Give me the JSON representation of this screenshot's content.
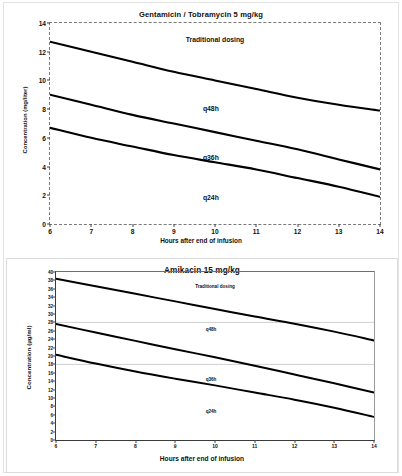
{
  "document": {
    "kind": "two-panel pharmacokinetic figure"
  },
  "charts": [
    {
      "id": "gentamicin-tobramycin",
      "title": "Gentamicin / Tobramycin   5 mg/kg",
      "xlabel": "Hours after end of infusion",
      "ylabel": "Concentration (mg/liter)",
      "xticks": [
        "6",
        "7",
        "8",
        "9",
        "10",
        "11",
        "12",
        "13",
        "14"
      ],
      "yticks": [
        "0",
        "2",
        "4",
        "6",
        "8",
        "10",
        "12",
        "14"
      ],
      "annotations": [
        {
          "text": "Traditional dosing",
          "x": 10.0,
          "y": 12.9
        },
        {
          "text": "q48h",
          "x": 9.9,
          "y": 8.1
        },
        {
          "text": "q36h",
          "x": 9.9,
          "y": 4.7
        },
        {
          "text": "q24h",
          "x": 9.9,
          "y": 1.9
        }
      ]
    },
    {
      "id": "amikacin",
      "title": "Amikacin  15 mg/kg",
      "xlabel": "Hours after end of infusion",
      "ylabel": "Concentration (µg/ml)",
      "xticks": [
        "6",
        "7",
        "8",
        "9",
        "10",
        "11",
        "12",
        "13",
        "14"
      ],
      "yticks": [
        "0",
        "2",
        "4",
        "6",
        "8",
        "10",
        "12",
        "14",
        "16",
        "18",
        "20",
        "22",
        "24",
        "26",
        "28",
        "30",
        "32",
        "34",
        "36",
        "38",
        "40"
      ],
      "annotations": [
        {
          "text": "Traditional dosing",
          "x": 10.0,
          "y": 36.6
        },
        {
          "text": "q48h",
          "x": 9.9,
          "y": 26.4
        },
        {
          "text": "q36h",
          "x": 9.9,
          "y": 14.6
        },
        {
          "text": "q24h",
          "x": 9.9,
          "y": 6.9
        }
      ]
    }
  ],
  "chart_data": [
    {
      "type": "line",
      "id": "gentamicin-tobramycin",
      "title": "Gentamicin / Tobramycin   5 mg/kg",
      "xlabel": "Hours after end of infusion",
      "ylabel": "Concentration (mg/liter)",
      "xlim": [
        6,
        14
      ],
      "ylim": [
        0,
        14
      ],
      "xticks": [
        6,
        7,
        8,
        9,
        10,
        11,
        12,
        13,
        14
      ],
      "yticks": [
        0,
        2,
        4,
        6,
        8,
        10,
        12,
        14
      ],
      "grid": false,
      "border_style": "dashed",
      "legend": "inline-labels",
      "x": [
        6,
        7,
        8,
        9,
        10,
        11,
        12,
        13,
        14
      ],
      "series": [
        {
          "name": "Traditional dosing",
          "values": [
            12.7,
            12.0,
            11.3,
            10.6,
            10.0,
            9.4,
            8.8,
            8.3,
            7.9
          ]
        },
        {
          "name": "q48h",
          "values": [
            9.0,
            8.3,
            7.6,
            7.0,
            6.4,
            5.8,
            5.2,
            4.5,
            3.8
          ]
        },
        {
          "name": "q36h",
          "values": [
            6.7,
            6.0,
            5.4,
            4.8,
            4.3,
            3.8,
            3.2,
            2.6,
            1.9
          ]
        }
      ],
      "annotations": [
        "Traditional dosing",
        "q48h",
        "q36h",
        "q24h"
      ]
    },
    {
      "type": "line",
      "id": "amikacin",
      "title": "Amikacin  15 mg/kg",
      "xlabel": "Hours after end of infusion",
      "ylabel": "Concentration (µg/ml)",
      "xlim": [
        6,
        14
      ],
      "ylim": [
        0,
        40
      ],
      "xticks": [
        6,
        7,
        8,
        9,
        10,
        11,
        12,
        13,
        14
      ],
      "yticks": [
        0,
        2,
        4,
        6,
        8,
        10,
        12,
        14,
        16,
        18,
        20,
        22,
        24,
        26,
        28,
        30,
        32,
        34,
        36,
        38,
        40
      ],
      "grid": true,
      "gridlines_y": [
        28,
        18
      ],
      "border_style": "solid",
      "legend": "inline-labels",
      "x": [
        6,
        7,
        8,
        9,
        10,
        11,
        12,
        13,
        14
      ],
      "series": [
        {
          "name": "Traditional dosing",
          "values": [
            38.4,
            36.6,
            34.8,
            33.0,
            31.2,
            29.4,
            27.7,
            25.8,
            23.7
          ]
        },
        {
          "name": "q48h",
          "values": [
            27.6,
            25.6,
            23.6,
            21.6,
            19.7,
            17.7,
            15.6,
            13.5,
            11.3
          ]
        },
        {
          "name": "q36h",
          "values": [
            20.3,
            18.2,
            16.3,
            14.6,
            13.0,
            11.3,
            9.6,
            7.7,
            5.5
          ]
        }
      ],
      "annotations": [
        "Traditional dosing",
        "q48h",
        "q36h",
        "q24h"
      ]
    }
  ]
}
